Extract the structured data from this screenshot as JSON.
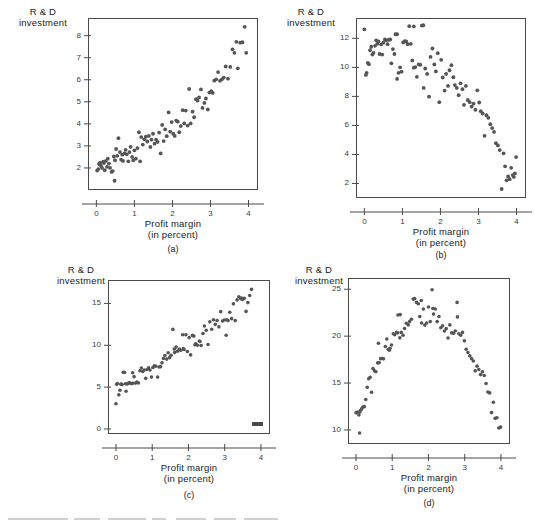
{
  "figure": {
    "ylabel": "R & D\ninvestment",
    "xlabel": "Profit margin\n(in percent)",
    "dot_color": "#555555",
    "axis_color": "#4a4a4a"
  },
  "chart_data": [
    {
      "id": "a",
      "type": "scatter",
      "caption": "(a)",
      "title": "",
      "xlabel": "Profit margin (in percent)",
      "ylabel": "R & D investment",
      "xlim": [
        -0.22,
        4.25
      ],
      "ylim": [
        1.0,
        8.8
      ],
      "xticks": [
        0,
        1,
        2,
        3,
        4
      ],
      "yticks": [
        2,
        3,
        4,
        5,
        6,
        7,
        8
      ],
      "xticklabels": [
        "0",
        "1",
        "2",
        "3",
        "4"
      ],
      "yticklabels": [
        "2",
        "3",
        "4",
        "5",
        "6",
        "7",
        "8"
      ],
      "grid": false,
      "legend": null,
      "relationship": "positive linear",
      "x": [
        0.02,
        0.05,
        0.07,
        0.1,
        0.12,
        0.15,
        0.18,
        0.2,
        0.22,
        0.25,
        0.28,
        0.3,
        0.33,
        0.36,
        0.4,
        0.43,
        0.46,
        0.49,
        0.52,
        0.55,
        0.58,
        0.62,
        0.65,
        0.68,
        0.7,
        0.74,
        0.77,
        0.8,
        0.84,
        0.87,
        0.9,
        0.94,
        0.97,
        1.0,
        1.04,
        1.08,
        1.12,
        1.15,
        1.18,
        1.22,
        1.26,
        1.3,
        1.34,
        1.38,
        1.42,
        1.45,
        1.49,
        1.53,
        1.57,
        1.61,
        1.65,
        1.69,
        1.73,
        1.77,
        1.81,
        1.85,
        1.9,
        1.94,
        1.98,
        2.02,
        2.06,
        2.1,
        2.14,
        2.18,
        2.22,
        2.27,
        2.31,
        2.35,
        2.4,
        2.44,
        2.48,
        2.53,
        2.57,
        2.62,
        2.66,
        2.7,
        2.75,
        2.79,
        2.84,
        2.88,
        2.93,
        2.97,
        3.02,
        3.06,
        3.1,
        3.15,
        3.2,
        3.25,
        3.3,
        3.35,
        3.4,
        3.46,
        3.52,
        3.58,
        3.63,
        3.68,
        3.72,
        3.78,
        3.84,
        3.9,
        3.94,
        0.48
      ],
      "y": [
        1.88,
        1.95,
        2.18,
        2.24,
        2.1,
        2.0,
        2.28,
        2.22,
        1.9,
        2.32,
        2.05,
        2.42,
        2.2,
        2.0,
        1.82,
        1.86,
        2.52,
        2.35,
        2.86,
        2.55,
        3.35,
        2.72,
        2.38,
        2.6,
        2.32,
        2.66,
        2.82,
        2.62,
        2.3,
        2.72,
        2.96,
        2.5,
        2.35,
        2.8,
        2.42,
        2.9,
        3.62,
        2.3,
        3.4,
        3.06,
        3.3,
        3.42,
        3.2,
        3.45,
        2.95,
        3.28,
        3.55,
        3.1,
        3.28,
        3.18,
        3.6,
        2.66,
        3.95,
        3.22,
        3.75,
        3.44,
        4.52,
        3.65,
        4.08,
        3.55,
        3.45,
        4.15,
        4.1,
        3.62,
        3.9,
        4.62,
        4.02,
        4.6,
        3.92,
        5.58,
        4.02,
        4.55,
        4.3,
        5.12,
        5.05,
        5.2,
        5.56,
        4.72,
        4.95,
        5.15,
        4.65,
        5.42,
        5.48,
        5.4,
        5.96,
        6.02,
        6.35,
        5.95,
        6.02,
        6.1,
        6.6,
        6.05,
        6.58,
        7.38,
        7.22,
        7.72,
        6.52,
        7.68,
        7.7,
        8.4,
        7.22,
        1.42
      ]
    },
    {
      "id": "b",
      "type": "scatter",
      "caption": "(b)",
      "title": "",
      "xlabel": "Profit margin (in percent)",
      "ylabel": "R & D investment",
      "xlim": [
        -0.22,
        4.25
      ],
      "ylim": [
        1.0,
        13.4
      ],
      "xticks": [
        0,
        1,
        2,
        3,
        4
      ],
      "yticks": [
        2,
        4,
        6,
        8,
        10,
        12
      ],
      "xticklabels": [
        "0",
        "1",
        "2",
        "3",
        "4"
      ],
      "yticklabels": [
        "2",
        "4",
        "6",
        "8",
        "10",
        "12"
      ],
      "grid": false,
      "legend": null,
      "relationship": "negative curvilinear (concave down, steep decline at high x)",
      "x": [
        0.0,
        0.04,
        0.06,
        0.09,
        0.12,
        0.15,
        0.18,
        0.21,
        0.24,
        0.28,
        0.31,
        0.34,
        0.37,
        0.4,
        0.44,
        0.47,
        0.5,
        0.54,
        0.57,
        0.61,
        0.64,
        0.68,
        0.71,
        0.75,
        0.79,
        0.82,
        0.86,
        0.9,
        0.94,
        0.98,
        1.02,
        1.06,
        1.1,
        1.14,
        1.18,
        1.22,
        1.26,
        1.3,
        1.34,
        1.38,
        1.43,
        1.47,
        1.51,
        1.56,
        1.6,
        1.65,
        1.7,
        1.74,
        1.79,
        1.84,
        1.88,
        1.93,
        1.97,
        2.02,
        2.06,
        2.11,
        2.15,
        2.2,
        2.24,
        2.29,
        2.34,
        2.38,
        2.43,
        2.48,
        2.53,
        2.58,
        2.62,
        2.67,
        2.72,
        2.77,
        2.82,
        2.87,
        2.92,
        2.97,
        3.02,
        3.06,
        3.11,
        3.16,
        3.21,
        3.26,
        3.31,
        3.36,
        3.41,
        3.46,
        3.51,
        3.56,
        3.61,
        3.66,
        3.7,
        3.74,
        3.78,
        3.82,
        3.86,
        3.9,
        3.93,
        3.96,
        3.99,
        1.55,
        1.3,
        0.86
      ],
      "y": [
        12.62,
        9.48,
        9.62,
        10.3,
        10.22,
        11.18,
        11.42,
        10.88,
        11.0,
        11.48,
        11.86,
        11.62,
        11.78,
        10.92,
        11.58,
        10.88,
        11.7,
        11.92,
        11.86,
        11.6,
        11.9,
        11.92,
        10.28,
        11.26,
        10.92,
        12.28,
        9.2,
        9.62,
        10.0,
        9.7,
        11.72,
        11.8,
        11.78,
        11.6,
        12.84,
        11.62,
        10.48,
        9.98,
        10.02,
        9.35,
        10.2,
        10.18,
        12.88,
        8.58,
        9.92,
        9.55,
        7.98,
        10.72,
        11.3,
        10.2,
        9.72,
        10.98,
        7.6,
        10.52,
        9.3,
        8.4,
        9.55,
        8.72,
        9.8,
        10.15,
        9.32,
        8.78,
        8.58,
        8.08,
        8.9,
        8.5,
        7.42,
        8.72,
        7.75,
        7.6,
        7.3,
        7.5,
        7.08,
        8.42,
        7.58,
        6.98,
        6.82,
        5.28,
        6.7,
        6.52,
        6.08,
        5.82,
        5.55,
        4.78,
        4.62,
        4.3,
        1.62,
        4.08,
        3.18,
        2.22,
        2.48,
        2.3,
        3.08,
        2.58,
        2.45,
        2.7,
        3.82,
        12.9,
        12.82,
        12.28
      ]
    },
    {
      "id": "c",
      "type": "scatter",
      "caption": "(c)",
      "title": "",
      "xlabel": "Profit margin (in percent)",
      "ylabel": "R & D investment",
      "xlim": [
        -0.22,
        4.25
      ],
      "ylim": [
        -0.6,
        17.8
      ],
      "xticks": [
        0,
        1,
        2,
        3,
        4
      ],
      "yticks": [
        0,
        5,
        10,
        15
      ],
      "xticklabels": [
        "0",
        "1",
        "2",
        "3",
        "4"
      ],
      "yticklabels": [
        "0",
        "5",
        "10",
        "15"
      ],
      "grid": false,
      "legend": null,
      "relationship": "positive linear with increasing spread",
      "annotation_mark": {
        "x": 3.62,
        "y": 0.18,
        "shape": "small dark rectangle"
      },
      "x": [
        0.0,
        0.04,
        0.08,
        0.11,
        0.14,
        0.17,
        0.2,
        0.24,
        0.28,
        0.31,
        0.35,
        0.38,
        0.42,
        0.46,
        0.5,
        0.54,
        0.58,
        0.62,
        0.66,
        0.7,
        0.74,
        0.78,
        0.82,
        0.86,
        0.9,
        0.94,
        0.98,
        1.02,
        1.06,
        1.1,
        1.15,
        1.19,
        1.23,
        1.27,
        1.31,
        1.35,
        1.4,
        1.44,
        1.48,
        1.52,
        1.57,
        1.61,
        1.66,
        1.7,
        1.75,
        1.79,
        1.84,
        1.88,
        1.93,
        1.97,
        2.02,
        2.06,
        2.11,
        2.15,
        2.2,
        2.25,
        2.3,
        2.35,
        2.4,
        2.44,
        2.49,
        2.54,
        2.59,
        2.64,
        2.69,
        2.74,
        2.79,
        2.84,
        2.89,
        2.94,
        2.99,
        3.04,
        3.09,
        3.14,
        3.19,
        3.24,
        3.29,
        3.34,
        3.39,
        3.44,
        3.49,
        3.54,
        3.59,
        3.64,
        3.69,
        3.74,
        0.02,
        0.14,
        0.26,
        0.46,
        1.62,
        1.86,
        2.18,
        2.32,
        3.06,
        3.46
      ],
      "y": [
        3.02,
        5.42,
        4.08,
        4.62,
        5.38,
        5.3,
        6.78,
        6.75,
        4.5,
        5.38,
        5.48,
        5.52,
        5.42,
        6.72,
        6.25,
        5.48,
        5.6,
        5.5,
        6.95,
        7.28,
        6.88,
        7.05,
        6.05,
        7.1,
        7.32,
        7.05,
        6.2,
        7.35,
        7.55,
        7.5,
        6.2,
        7.4,
        7.45,
        7.9,
        8.42,
        8.78,
        8.35,
        9.1,
        8.52,
        8.8,
        11.9,
        9.55,
        9.8,
        9.3,
        9.55,
        9.4,
        11.25,
        9.5,
        11.25,
        9.25,
        10.92,
        8.85,
        11.18,
        11.1,
        10.18,
        10.0,
        10.52,
        9.98,
        11.4,
        12.3,
        11.8,
        10.1,
        12.8,
        11.92,
        13.05,
        12.5,
        12.95,
        12.2,
        14.02,
        12.9,
        13.02,
        11.2,
        12.95,
        13.95,
        13.18,
        14.95,
        12.95,
        15.42,
        15.8,
        15.58,
        15.48,
        15.62,
        14.05,
        15.1,
        15.95,
        16.68,
        5.35,
        5.35,
        5.4,
        5.45,
        9.15,
        9.6,
        10.05,
        10.45,
        13.05,
        15.65
      ]
    },
    {
      "id": "d",
      "type": "scatter",
      "caption": "(d)",
      "title": "",
      "xlabel": "Profit margin (in percent)",
      "ylabel": "R & D investment",
      "xlim": [
        -0.22,
        4.25
      ],
      "ylim": [
        8.5,
        26.2
      ],
      "xticks": [
        0,
        1,
        2,
        3,
        4
      ],
      "yticks": [
        10,
        15,
        20,
        25
      ],
      "xticklabels": [
        "0",
        "1",
        "2",
        "3",
        "4"
      ],
      "yticklabels": [
        "10",
        "15",
        "20",
        "25"
      ],
      "grid": false,
      "legend": null,
      "relationship": "inverted-U (quadratic, peak near x = 2)",
      "x": [
        0.0,
        0.04,
        0.08,
        0.1,
        0.13,
        0.16,
        0.19,
        0.23,
        0.27,
        0.31,
        0.35,
        0.39,
        0.43,
        0.47,
        0.51,
        0.55,
        0.6,
        0.64,
        0.68,
        0.72,
        0.76,
        0.81,
        0.85,
        0.89,
        0.94,
        0.98,
        1.03,
        1.07,
        1.12,
        1.16,
        1.21,
        1.25,
        1.3,
        1.34,
        1.39,
        1.44,
        1.48,
        1.53,
        1.58,
        1.62,
        1.67,
        1.72,
        1.76,
        1.81,
        1.86,
        1.9,
        1.95,
        2.0,
        2.05,
        2.1,
        2.14,
        2.19,
        2.24,
        2.29,
        2.34,
        2.39,
        2.44,
        2.49,
        2.54,
        2.59,
        2.64,
        2.69,
        2.74,
        2.79,
        2.84,
        2.89,
        2.94,
        2.99,
        3.04,
        3.09,
        3.14,
        3.19,
        3.24,
        3.29,
        3.34,
        3.39,
        3.44,
        3.49,
        3.54,
        3.59,
        3.64,
        3.69,
        3.74,
        3.79,
        3.84,
        3.89,
        3.94,
        3.99,
        0.1,
        1.22,
        1.8,
        2.12,
        2.8,
        0.62,
        0.92,
        1.15
      ],
      "y": [
        11.82,
        11.9,
        11.6,
        9.68,
        12.1,
        12.28,
        12.45,
        12.48,
        13.25,
        14.55,
        15.45,
        15.62,
        14.02,
        16.55,
        16.3,
        16.2,
        17.15,
        17.18,
        17.6,
        17.62,
        17.58,
        18.9,
        19.7,
        18.6,
        18.7,
        19.05,
        20.25,
        20.15,
        20.4,
        22.25,
        19.82,
        20.4,
        20.1,
        20.82,
        21.38,
        21.2,
        21.55,
        21.8,
        23.95,
        24.0,
        23.6,
        23.45,
        22.1,
        21.4,
        22.9,
        21.18,
        21.4,
        23.1,
        21.55,
        24.95,
        22.35,
        22.9,
        21.55,
        22.1,
        20.9,
        21.1,
        20.55,
        20.8,
        19.8,
        21.2,
        20.35,
        20.3,
        20.55,
        23.6,
        20.25,
        20.1,
        20.4,
        19.5,
        18.6,
        18.25,
        17.9,
        17.6,
        17.35,
        16.3,
        16.8,
        16.45,
        15.9,
        16.2,
        15.8,
        14.95,
        14.05,
        13.95,
        11.85,
        12.95,
        11.25,
        11.3,
        10.2,
        10.3,
        11.88,
        22.3,
        23.8,
        22.95,
        22.05,
        19.25,
        18.5,
        20.35
      ]
    }
  ]
}
